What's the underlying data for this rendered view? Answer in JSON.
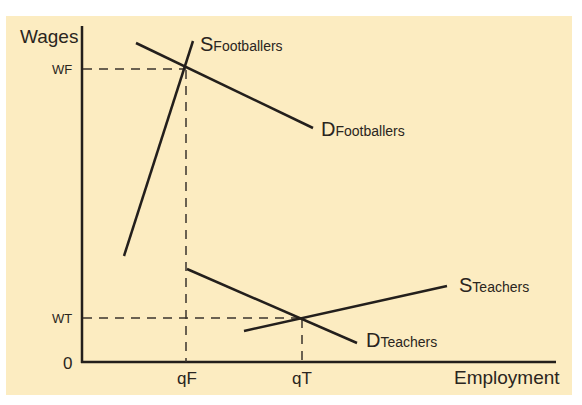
{
  "caption": "Figure ... Wages",
  "axes": {
    "y_label": "Wages",
    "x_label": "Employment",
    "origin": "0"
  },
  "labels": {
    "wf": "WF",
    "wt": "WT",
    "qf": "qF",
    "qt": "qT"
  },
  "curves": {
    "s_footballers": {
      "main": "S",
      "sub": "Footballers"
    },
    "d_footballers": {
      "main": "D",
      "sub": "Footballers"
    },
    "s_teachers": {
      "main": "S",
      "sub": "Teachers"
    },
    "d_teachers": {
      "main": "D",
      "sub": "Teachers"
    }
  },
  "colors": {
    "background": "#fcecc1",
    "line": "#231f1c"
  }
}
